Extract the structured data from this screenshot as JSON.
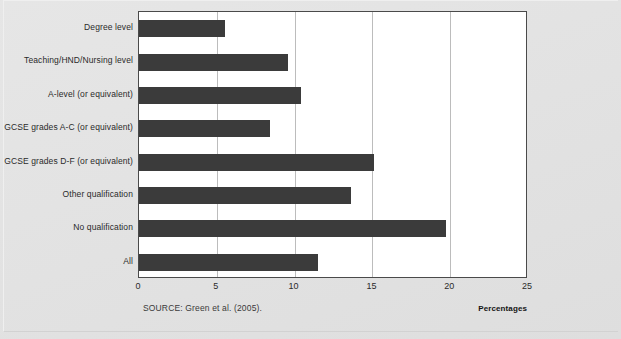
{
  "chart_data": {
    "type": "bar",
    "orientation": "horizontal",
    "title": "",
    "xlabel": "Percentages",
    "ylabel": "",
    "xlim": [
      0,
      25
    ],
    "xticks": [
      0,
      5,
      10,
      15,
      20,
      25
    ],
    "xticklabels": [
      "0",
      "5",
      "10",
      "15",
      "20",
      "25"
    ],
    "grid": "vertical",
    "legend": "none",
    "categories": [
      "Degree level",
      "Teaching/HND/Nursing level",
      "A-level (or equivalent)",
      "GCSE grades A-C (or equivalent)",
      "GCSE grades D-F (or equivalent)",
      "Other qualification",
      "No qualification",
      "All"
    ],
    "values": [
      5.5,
      9.6,
      10.4,
      8.4,
      15.1,
      13.6,
      19.7,
      11.5
    ],
    "bar_color": "#3b3b3b",
    "source": "SOURCE: Green et al. (2005)."
  },
  "footer": {
    "source_text": "SOURCE: Green et al. (2005).",
    "unit_label": "Percentages"
  },
  "colors": {
    "bar": "#3b3b3b",
    "grid": "#bcbcbc",
    "frame": "#4a4a4a",
    "page_background": "#e4e4e4",
    "plot_background": "#ffffff"
  }
}
